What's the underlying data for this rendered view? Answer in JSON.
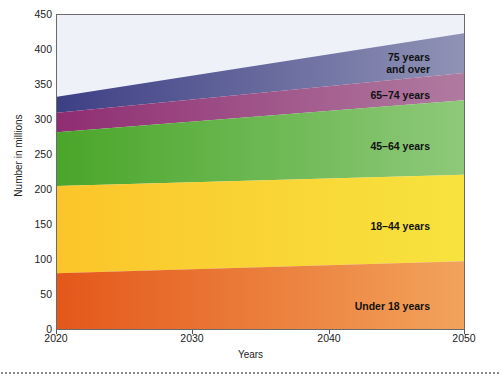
{
  "chart_data": {
    "type": "area",
    "stacked": true,
    "title": "",
    "xlabel": "Years",
    "ylabel": "Number in millions",
    "x": [
      2020,
      2050
    ],
    "xlim": [
      2020,
      2050
    ],
    "ylim": [
      0,
      450
    ],
    "xticks": [
      "2020",
      "2030",
      "2040",
      "2050"
    ],
    "xtick_values": [
      2020,
      2030,
      2040,
      2050
    ],
    "yticks": [
      "0",
      "50",
      "100",
      "150",
      "200",
      "250",
      "300",
      "350",
      "400",
      "450"
    ],
    "ytick_values": [
      0,
      50,
      100,
      150,
      200,
      250,
      300,
      350,
      400,
      450
    ],
    "grid": false,
    "legend_position": "in-plot-labels",
    "series": [
      {
        "name": "Under 18 years",
        "color": "#e8631f",
        "values": [
          80,
          97
        ]
      },
      {
        "name": "18–44 years",
        "color": "#f8c633",
        "values": [
          125,
          124
        ]
      },
      {
        "name": "45–64 years",
        "color": "#4faa33",
        "values": [
          77,
          107
        ]
      },
      {
        "name": "65–74 years",
        "color": "#9c3d7a",
        "values": [
          28,
          39
        ]
      },
      {
        "name": "75 years and over",
        "color": "#4a4d8f",
        "values": [
          23,
          57
        ]
      }
    ],
    "cumulative_tops": {
      "2020": [
        80,
        205,
        282,
        310,
        333
      ],
      "2050": [
        97,
        221,
        328,
        367,
        424
      ]
    },
    "totals": [
      333,
      424
    ],
    "background_color": "#eef1f7",
    "frame_color": "#6b6b6b"
  },
  "axes": {
    "y_title": "Number in millions",
    "x_title": "Years",
    "y_ticks": [
      "450",
      "400",
      "350",
      "300",
      "250",
      "200",
      "150",
      "100",
      "50",
      "0"
    ],
    "x_ticks": [
      "2020",
      "2030",
      "2040",
      "2050"
    ]
  },
  "series_labels": [
    {
      "id": "label-75-and-over",
      "text": "75 years\nand over"
    },
    {
      "id": "label-65-74",
      "text": "65–74 years"
    },
    {
      "id": "label-45-64",
      "text": "45–64 years"
    },
    {
      "id": "label-18-44",
      "text": "18–44 years"
    },
    {
      "id": "label-under-18",
      "text": "Under 18 years"
    }
  ]
}
